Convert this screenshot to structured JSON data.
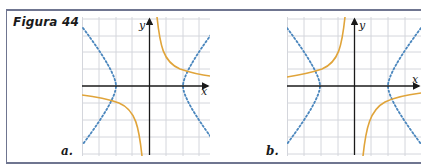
{
  "figure": {
    "title": "Figura 44",
    "frame_color": "#6f7590"
  },
  "panels": [
    {
      "label": "a.",
      "x_axis_label": "x",
      "y_axis_label": "y",
      "curves": [
        {
          "name": "hyperbola-k-over-x",
          "style": "solid",
          "color": "#e0a43a",
          "equation": "y = k/x (k>0)",
          "quadrants": [
            "I",
            "III"
          ]
        },
        {
          "name": "hyperbola-horizontal",
          "style": "dotted",
          "color": "#4a86bd",
          "equation": "x^2/a^2 - y^2/b^2 = 1",
          "vertices": [
            "(-2,0)",
            "(2,0)"
          ]
        }
      ]
    },
    {
      "label": "b.",
      "x_axis_label": "x",
      "y_axis_label": "y",
      "curves": [
        {
          "name": "hyperbola-neg-k-over-x",
          "style": "solid",
          "color": "#e0a43a",
          "equation": "y = -k/x (k>0)",
          "quadrants": [
            "II",
            "IV"
          ]
        },
        {
          "name": "hyperbola-horizontal",
          "style": "dotted",
          "color": "#4a86bd",
          "equation": "x^2/a^2 - y^2/b^2 = 1",
          "vertices": [
            "(-2,0)",
            "(2,0)"
          ]
        }
      ]
    }
  ],
  "colors": {
    "grid": "#d4d6dc",
    "axis": "#1a1a1a",
    "curve_orange": "#e0a43a",
    "curve_blue": "#4a86bd"
  }
}
